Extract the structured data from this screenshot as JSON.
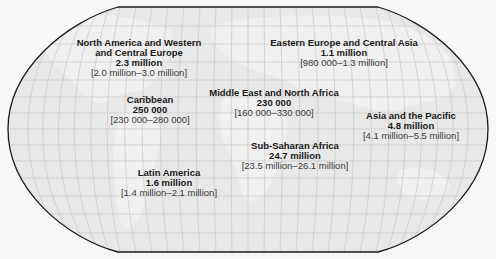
{
  "map": {
    "type": "world-region-choropleth",
    "projection": "Robinson-like",
    "colors": {
      "background": "#f7f7f7",
      "ocean_fill": "#e6e6e6",
      "land_fill": "#efefef",
      "outline": "#1a1a1a",
      "graticule": "#c4c4c4",
      "text": "#1a1a1a"
    },
    "regions": [
      {
        "name_line1": "North America and Western",
        "name_line2": "and Central Europe",
        "value": "2.3 million",
        "range": "[2.0 million–3.0 million]"
      },
      {
        "name_line1": "Eastern Europe and Central Asia",
        "value": "1.1 million",
        "range": "[980 000–1.3 million]"
      },
      {
        "name_line1": "Caribbean",
        "value": "250 000",
        "range": "[230 000–280 000]"
      },
      {
        "name_line1": "Middle East and North Africa",
        "value": "230 000",
        "range": "[160 000–330 000]"
      },
      {
        "name_line1": "Asia and the Pacific",
        "value": "4.8 million",
        "range": "[4.1 million–5.5 million]"
      },
      {
        "name_line1": "Sub-Saharan Africa",
        "value": "24.7 million",
        "range": "[23.5 million–26.1 million]"
      },
      {
        "name_line1": "Latin America",
        "value": "1.6 million",
        "range": "[1.4 million–2.1 million]"
      }
    ]
  }
}
